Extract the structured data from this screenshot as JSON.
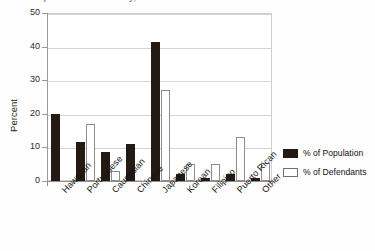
{
  "chart_data": {
    "type": "bar",
    "title": "Comparison of Ethnicity,",
    "xlabel": "",
    "ylabel": "Percent",
    "ylim": [
      0,
      50
    ],
    "yticks": [
      0,
      10,
      20,
      30,
      40,
      50
    ],
    "grid": true,
    "legend_position": "right",
    "categories": [
      "Hawaiian",
      "Portuguese",
      "Caucasian",
      "Chinese",
      "Japanese",
      "Korean",
      "Filipino",
      "Puerto Rican",
      "Other"
    ],
    "series": [
      {
        "name": "% of Population",
        "color": "#241a14",
        "values": [
          20,
          11.5,
          8.5,
          11,
          41.5,
          2,
          1,
          2,
          1
        ]
      },
      {
        "name": "% of Defendants",
        "color": "#ffffff",
        "values": [
          0,
          17,
          3,
          0,
          27,
          5,
          5,
          13,
          5.5
        ]
      }
    ]
  },
  "legend": {
    "items": [
      {
        "label": "% of Population",
        "swatch": "filled-dark"
      },
      {
        "label": "% of Defendants",
        "swatch": "outlined-white"
      }
    ]
  },
  "axes": {
    "y_labels": [
      "50",
      "40",
      "30",
      "20",
      "10",
      "0"
    ],
    "y_title": "Percent"
  }
}
